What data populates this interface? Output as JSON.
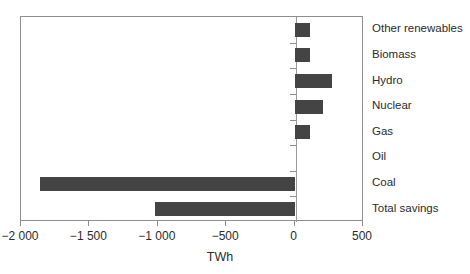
{
  "chart_data": {
    "type": "bar",
    "orientation": "horizontal",
    "title": "",
    "xlabel": "TWh",
    "ylabel": "",
    "xlim": [
      -2000,
      500
    ],
    "grid": false,
    "legend": null,
    "bar_color": "#444444",
    "axis_color": "#8d8d8d",
    "xticks": [
      -2000,
      -1500,
      -1000,
      -500,
      0,
      500
    ],
    "xtick_labels": [
      "−2 000",
      "−1 500",
      "−1 000",
      "−500",
      "0",
      "500"
    ],
    "categories": [
      "Other renewables",
      "Biomass",
      "Hydro",
      "Nuclear",
      "Gas",
      "Oil",
      "Coal",
      "Total savings"
    ],
    "values": [
      115,
      115,
      270,
      210,
      115,
      0,
      -1860,
      -1020
    ],
    "series": [
      {
        "name": "Change",
        "values": [
          115,
          115,
          270,
          210,
          115,
          0,
          -1860,
          -1020
        ]
      }
    ]
  },
  "axis": {
    "x_title": "TWh"
  }
}
